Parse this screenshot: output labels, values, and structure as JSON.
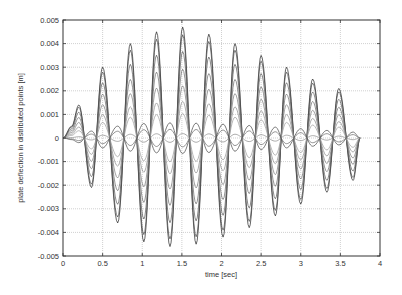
{
  "chart_data": {
    "type": "line",
    "title": "",
    "xlabel": "time [sec]",
    "ylabel": "plate deflection in distributed points [m]",
    "xlim": [
      0,
      4
    ],
    "ylim": [
      -0.005,
      0.005
    ],
    "xticks": [
      0,
      0.5,
      1,
      1.5,
      2,
      2.5,
      3,
      3.5,
      4
    ],
    "xtick_labels": [
      "0",
      "0.5",
      "1",
      "1.5",
      "2",
      "2.5",
      "3",
      "3.5",
      "4"
    ],
    "yticks": [
      -0.005,
      -0.004,
      -0.003,
      -0.002,
      -0.001,
      0,
      0.001,
      0.002,
      0.003,
      0.004,
      0.005
    ],
    "ytick_labels": [
      "-0.005",
      "-0.004",
      "-0.003",
      "-0.002",
      "-0.001",
      "0",
      "0.001",
      "0.002",
      "0.003",
      "0.004",
      "0.005"
    ],
    "grid": true,
    "legend": null,
    "line_color": "#333333",
    "grid_color": "#b0b0b0",
    "envelope": {
      "description": "Outermost curve extrema (time sec, deflection m); other curves are scaled copies",
      "x": [
        0.0,
        0.11,
        0.2,
        0.36,
        0.5,
        0.69,
        0.85,
        1.02,
        1.18,
        1.35,
        1.51,
        1.68,
        1.84,
        2.02,
        2.17,
        2.35,
        2.5,
        2.68,
        2.82,
        3.0,
        3.15,
        3.33,
        3.48,
        3.66,
        3.75
      ],
      "y": [
        0.0,
        0.0005,
        0.0014,
        -0.0021,
        0.003,
        -0.0036,
        0.004,
        -0.0044,
        0.0045,
        -0.0046,
        0.0047,
        -0.0045,
        0.0044,
        -0.0042,
        0.004,
        -0.0038,
        0.0035,
        -0.0033,
        0.003,
        -0.0028,
        0.0025,
        -0.0023,
        0.0021,
        -0.0018,
        0.0
      ]
    },
    "series": [
      {
        "name": "point 1",
        "scale": 1.0
      },
      {
        "name": "point 2",
        "scale": 0.93
      },
      {
        "name": "point 3",
        "scale": 0.78
      },
      {
        "name": "point 4",
        "scale": 0.62
      },
      {
        "name": "point 5",
        "scale": 0.47
      },
      {
        "name": "point 6",
        "scale": 0.33
      },
      {
        "name": "point 7",
        "scale": 0.22
      },
      {
        "name": "point 8",
        "scale": -0.14
      },
      {
        "name": "point 9",
        "scale": -0.08
      },
      {
        "name": "point 10",
        "scale": 0.04
      }
    ]
  }
}
